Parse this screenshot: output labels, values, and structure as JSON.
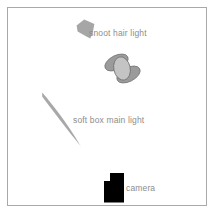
{
  "diagram": {
    "frame": {
      "border_color": "#a9a9a9",
      "background_color": "#ffffff"
    },
    "label_color": "#8d8d8d",
    "elements": [
      {
        "id": "snoot-hair-light",
        "label": "snoot hair light",
        "icon": "snoot-light-icon",
        "shape": "tapered-cone",
        "fill": "#a6a6a6",
        "x": 76,
        "y": 20
      },
      {
        "id": "umbrella-light",
        "label": "",
        "icon": "umbrella-light-icon",
        "shape": "overlapping-ellipses",
        "fill_back": "#9b9b9b",
        "fill_front": "#c4c4c4",
        "stroke": "#6f6f6f",
        "x": 104,
        "y": 54
      },
      {
        "id": "soft-box-main-light",
        "label": "soft box main light",
        "icon": "soft-box-light-icon",
        "shape": "thin-crescent-sliver",
        "fill": "#a8a8a8",
        "x": 40,
        "y": 92
      },
      {
        "id": "camera",
        "label": "camera",
        "icon": "camera-icon",
        "shape": "camera-body-with-viewfinder",
        "fill": "#000000",
        "x": 104,
        "y": 173
      }
    ]
  }
}
